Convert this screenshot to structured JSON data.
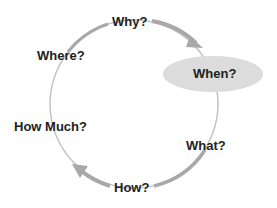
{
  "diagram": {
    "type": "cycle",
    "direction": "clockwise",
    "nodes": [
      {
        "id": "why",
        "label": "Why?"
      },
      {
        "id": "when",
        "label": "When?",
        "highlighted": true
      },
      {
        "id": "what",
        "label": "What?"
      },
      {
        "id": "how",
        "label": "How?"
      },
      {
        "id": "how_much",
        "label": "How Much?"
      },
      {
        "id": "where",
        "label": "Where?"
      }
    ],
    "colors": {
      "arrow": "#a8a8a8",
      "highlight_fill": "#dcdcdc",
      "text": "#222222"
    }
  }
}
